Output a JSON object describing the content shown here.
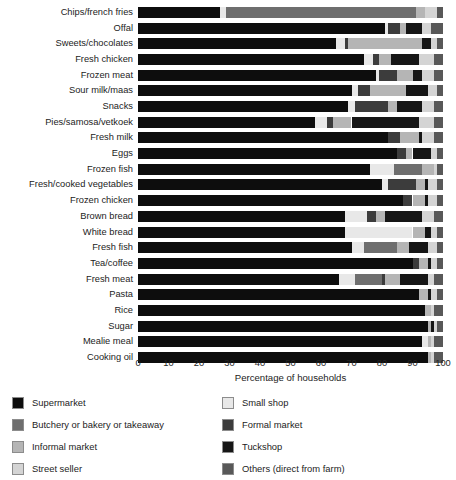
{
  "chart_data": {
    "type": "bar",
    "orientation": "horizontal",
    "stacked": true,
    "title": "",
    "xlabel": "Percentage of households",
    "ylabel": "",
    "xlim": [
      0,
      100
    ],
    "xticks": [
      0,
      10,
      20,
      30,
      40,
      50,
      60,
      70,
      80,
      90,
      100
    ],
    "grid": false,
    "legend_position": "below",
    "legend": [
      {
        "name": "Supermarket",
        "color": "#0d0d0d"
      },
      {
        "name": "Small shop",
        "color": "#e8e8e8"
      },
      {
        "name": "Butchery or bakery or takeaway",
        "color": "#6e6e6e"
      },
      {
        "name": "Formal market",
        "color": "#3c3c3c"
      },
      {
        "name": "Informal market",
        "color": "#b5b5b5"
      },
      {
        "name": "Tuckshop",
        "color": "#161616"
      },
      {
        "name": "Street seller",
        "color": "#d4d4d4"
      },
      {
        "name": "Others (direct from farm)",
        "color": "#585858"
      }
    ],
    "categories": [
      "Chips/french fries",
      "Offal",
      "Sweets/chocolates",
      "Fresh chicken",
      "Frozen meat",
      "Sour milk/maas",
      "Snacks",
      "Pies/samosa/vetkoek",
      "Fresh milk",
      "Eggs",
      "Frozen fish",
      "Fresh/cooked vegetables",
      "Frozen chicken",
      "Brown bread",
      "White bread",
      "Fresh fish",
      "Tea/coffee",
      "Fresh meat",
      "Pasta",
      "Rice",
      "Sugar",
      "Mealie meal",
      "Cooking oil"
    ],
    "series": [
      {
        "name": "Supermarket",
        "values": [
          27,
          81,
          65,
          74,
          78,
          70,
          69,
          58,
          82,
          85,
          76,
          80,
          87,
          68,
          68,
          70,
          90,
          66,
          92,
          94,
          95,
          93,
          95
        ]
      },
      {
        "name": "Small shop",
        "values": [
          2,
          1,
          3,
          3,
          1,
          2,
          2,
          4,
          0,
          0,
          8,
          2,
          0,
          7,
          22,
          4,
          0,
          5,
          0,
          0,
          0,
          2,
          0
        ]
      },
      {
        "name": "Butchery or bakery or takeaway",
        "values": [
          62,
          0,
          0,
          0,
          0,
          0,
          0,
          0,
          0,
          0,
          9,
          0,
          0,
          0,
          0,
          11,
          0,
          9,
          0,
          0,
          0,
          0,
          0
        ]
      },
      {
        "name": "Formal market",
        "values": [
          0,
          4,
          1,
          2,
          6,
          4,
          11,
          2,
          4,
          3,
          0,
          9,
          3,
          3,
          0,
          0,
          2,
          1,
          0,
          0,
          0,
          0,
          0
        ]
      },
      {
        "name": "Informal market",
        "values": [
          3,
          2,
          24,
          4,
          5,
          12,
          3,
          6,
          6,
          2,
          4,
          3,
          4,
          3,
          4,
          4,
          3,
          5,
          3,
          2,
          1,
          1,
          1
        ]
      },
      {
        "name": "Tuckshop",
        "values": [
          0,
          5,
          3,
          9,
          3,
          7,
          8,
          22,
          1,
          6,
          0,
          1,
          1,
          12,
          2,
          6,
          1,
          9,
          1,
          0,
          1,
          0,
          0
        ]
      },
      {
        "name": "Street seller",
        "values": [
          4,
          3,
          2,
          5,
          4,
          3,
          4,
          5,
          4,
          2,
          1,
          3,
          3,
          4,
          2,
          3,
          2,
          2,
          2,
          1,
          1,
          1,
          1
        ]
      },
      {
        "name": "Others (direct from farm)",
        "values": [
          2,
          4,
          2,
          3,
          3,
          2,
          3,
          3,
          3,
          2,
          2,
          2,
          2,
          3,
          2,
          2,
          2,
          3,
          2,
          3,
          2,
          3,
          3
        ]
      }
    ]
  },
  "axis": {
    "xlabel": "Percentage of households",
    "xticks": [
      "0",
      "10",
      "20",
      "30",
      "40",
      "50",
      "60",
      "70",
      "80",
      "90",
      "100"
    ]
  },
  "legend": {
    "left": [
      {
        "label": "Supermarket",
        "color": "#0d0d0d"
      },
      {
        "label": "Butchery or bakery or takeaway",
        "color": "#6e6e6e"
      },
      {
        "label": "Informal market",
        "color": "#b5b5b5"
      },
      {
        "label": "Street seller",
        "color": "#d4d4d4"
      }
    ],
    "right": [
      {
        "label": "Small shop",
        "color": "#e8e8e8"
      },
      {
        "label": "Formal market",
        "color": "#3c3c3c"
      },
      {
        "label": "Tuckshop",
        "color": "#161616"
      },
      {
        "label": "Others (direct from farm)",
        "color": "#585858"
      }
    ]
  }
}
